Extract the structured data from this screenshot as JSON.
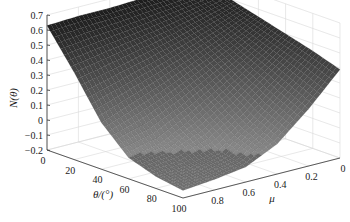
{
  "chart_data": {
    "type": "surface3d",
    "title": "",
    "xlabel": "θ/(°)",
    "ylabel": "μ",
    "zlabel": "N(θ)",
    "x_ticks": [
      "0",
      "20",
      "40",
      "60",
      "80",
      "100"
    ],
    "y_ticks": [
      "0",
      "0.2",
      "0.4",
      "0.6",
      "0.8"
    ],
    "z_ticks": [
      "0.7",
      "0.6",
      "0.5",
      "0.4",
      "0.3",
      "0.2",
      "0.1",
      "0",
      "−0.1",
      "−0.2"
    ],
    "xlim": [
      0,
      100
    ],
    "ylim": [
      0,
      1
    ],
    "zlim": [
      -0.2,
      0.7
    ],
    "grid": true,
    "colormap": "gray",
    "x": [
      0,
      20,
      40,
      60,
      80,
      100
    ],
    "y": [
      0,
      0.2,
      0.4,
      0.6,
      0.8,
      1.0
    ],
    "z": [
      [
        0.65,
        0.65,
        0.65,
        0.64,
        0.64,
        0.63
      ],
      [
        0.6,
        0.55,
        0.5,
        0.46,
        0.42,
        0.38
      ],
      [
        0.55,
        0.45,
        0.36,
        0.27,
        0.19,
        0.11
      ],
      [
        0.5,
        0.36,
        0.22,
        0.09,
        -0.02,
        -0.06
      ],
      [
        0.45,
        0.27,
        0.09,
        -0.05,
        -0.1,
        -0.12
      ],
      [
        0.39,
        0.18,
        0.0,
        -0.1,
        -0.13,
        -0.15
      ]
    ],
    "z_note": "rows indexed by θ (x), columns by μ (y); values estimated from surface corners"
  }
}
